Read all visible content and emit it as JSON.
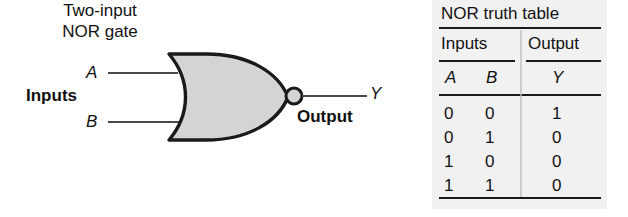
{
  "figure": {
    "input_labels": {
      "a": "A",
      "b": "B"
    },
    "inputs_group_label": "Inputs",
    "output_label": "Y",
    "output_group_label": "Output",
    "caption_line1": "Two-input",
    "caption_line2": "NOR gate",
    "gate_fill_color": "#d4d4d4",
    "gate_stroke_color": "#1a1a1a",
    "wire_color": "#4a4a4a"
  },
  "table": {
    "title": "NOR truth table",
    "group_headers": {
      "inputs": "Inputs",
      "output": "Output"
    },
    "column_headers": {
      "a": "A",
      "b": "B",
      "y": "Y"
    },
    "panel_color": "#f1f1f1",
    "rule_color": "#1a1a1a",
    "rows": [
      {
        "a": "0",
        "b": "0",
        "y": "1"
      },
      {
        "a": "0",
        "b": "1",
        "y": "0"
      },
      {
        "a": "1",
        "b": "0",
        "y": "0"
      },
      {
        "a": "1",
        "b": "1",
        "y": "0"
      }
    ]
  }
}
